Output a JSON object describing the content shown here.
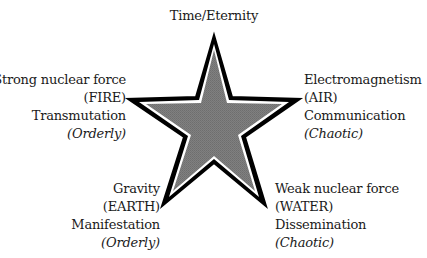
{
  "diagram": {
    "center_shape": "five-pointed-star",
    "colors": {
      "star_fill": "#7a7a7a",
      "star_outline": "#000000",
      "star_inner_border": "#ffffff",
      "text": "#1a1a1a"
    },
    "points": {
      "top": {
        "lines": [
          "Time/Eternity"
        ]
      },
      "upper_left": {
        "force": "Strong nuclear force",
        "element": "(FIRE)",
        "process": "Transmutation",
        "quality": "(Orderly)"
      },
      "upper_right": {
        "force": "Electromagnetism",
        "element": "(AIR)",
        "process": "Communication",
        "quality": "(Chaotic)"
      },
      "lower_left": {
        "force": "Gravity",
        "element": "(EARTH)",
        "process": "Manifestation",
        "quality": "(Orderly)"
      },
      "lower_right": {
        "force": "Weak nuclear force",
        "element": "(WATER)",
        "process": "Dissemination",
        "quality": "(Chaotic)"
      }
    }
  }
}
